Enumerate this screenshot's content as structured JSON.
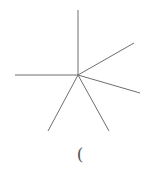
{
  "diagram": {
    "center": {
      "x": 78,
      "y": 75
    },
    "stroke_color": "#6e6e6e",
    "stroke_width": 1,
    "rays": [
      {
        "name": "ray-up",
        "x": 78,
        "y": 10
      },
      {
        "name": "ray-upper-right",
        "x": 134,
        "y": 43
      },
      {
        "name": "ray-lower-right",
        "x": 140,
        "y": 93
      },
      {
        "name": "ray-down-right",
        "x": 109,
        "y": 131
      },
      {
        "name": "ray-down-left",
        "x": 48,
        "y": 131
      },
      {
        "name": "ray-left",
        "x": 15,
        "y": 75
      }
    ]
  },
  "caption": {
    "text": "("
  }
}
